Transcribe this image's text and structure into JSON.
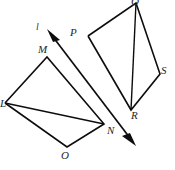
{
  "figure": {
    "background_color": "#ffffff",
    "stroke_color": "#0d0d0d",
    "label_color": "#262626",
    "width": 175,
    "height": 170
  },
  "shapes": [
    {
      "id": "quadrilateral-lmno",
      "name": "LMNO",
      "vertex_labels": [
        "L",
        "M",
        "N",
        "O"
      ],
      "outline_points": "5,103 47,57 104,124 67,147 5,103",
      "diagonal_points": "5,103 104,124",
      "diagonal_label": "LN"
    },
    {
      "id": "quadrilateral-pqsr",
      "name": "PQSR",
      "vertex_labels": [
        "P",
        "Q",
        "S",
        "R"
      ],
      "outline_points": "88,36 136,3 160,74 131,110 88,36",
      "diagonal_points": "136,3 131,110",
      "diagonal_label": "QR"
    }
  ],
  "arrow": {
    "id": "double-headed-arrow",
    "label": "l",
    "line_points": "50,33 133,142",
    "head_top_points": "47,29 60,40 53,42",
    "head_bottom_points": "136,146 122,136 130,133",
    "direction": "double"
  },
  "labels": {
    "l": {
      "text": "l",
      "x": 36,
      "y": 22
    },
    "L": {
      "text": "L",
      "x": 0,
      "y": 98
    },
    "M": {
      "text": "M",
      "x": 38,
      "y": 44
    },
    "N": {
      "text": "N",
      "x": 107,
      "y": 125
    },
    "O": {
      "text": "O",
      "x": 61,
      "y": 150
    },
    "P": {
      "text": "P",
      "x": 70,
      "y": 27
    },
    "Q": {
      "text": "Q",
      "x": 131,
      "y": -4
    },
    "R": {
      "text": "R",
      "x": 131,
      "y": 110
    },
    "S": {
      "text": "S",
      "x": 161,
      "y": 65
    }
  }
}
